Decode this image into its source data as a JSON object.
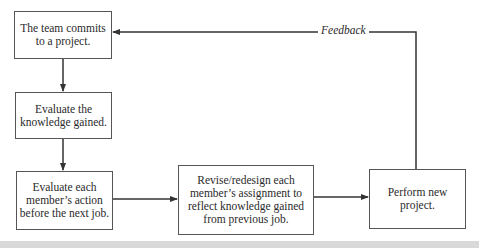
{
  "diagram": {
    "nodes": [
      {
        "id": "commit",
        "label": "The team commits\nto a project."
      },
      {
        "id": "evaluate-knowledge",
        "label": "Evaluate the\nknowledge gained."
      },
      {
        "id": "evaluate-members",
        "label": "Evaluate each\nmember’s action\nbefore the next job."
      },
      {
        "id": "revise",
        "label": "Revise/redesign each\nmember’s assignment to\nreflect knowledge gained\nfrom previous job."
      },
      {
        "id": "perform",
        "label": "Perform new\nproject."
      }
    ],
    "edges": [
      {
        "from": "commit",
        "to": "evaluate-knowledge"
      },
      {
        "from": "evaluate-knowledge",
        "to": "evaluate-members"
      },
      {
        "from": "evaluate-members",
        "to": "revise"
      },
      {
        "from": "revise",
        "to": "perform"
      },
      {
        "from": "perform",
        "to": "commit",
        "label": "Feedback"
      }
    ],
    "feedback_label": "Feedback",
    "colors": {
      "line": "#333333",
      "border": "#555555",
      "band": "#d9d9d9"
    }
  }
}
